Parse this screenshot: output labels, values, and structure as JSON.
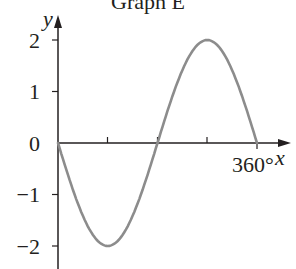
{
  "chart_data": {
    "type": "line",
    "title": "Graph E",
    "xlabel": "x",
    "ylabel": "y",
    "x_unit": "degrees",
    "xlim": [
      0,
      360
    ],
    "ylim": [
      -2,
      2
    ],
    "x_ticks": [
      90,
      180,
      270,
      360
    ],
    "x_tick_labels": [
      "",
      "",
      "",
      "360°"
    ],
    "y_ticks": [
      -2,
      -1,
      0,
      1,
      2
    ],
    "y_tick_labels": [
      "−2",
      "−1",
      "0",
      "1",
      "2"
    ],
    "grid": false,
    "series": [
      {
        "name": "y = -2 sin x",
        "x": [
          0,
          45,
          90,
          135,
          180,
          225,
          270,
          315,
          360
        ],
        "y": [
          0,
          -1.41,
          -2,
          -1.41,
          0,
          1.41,
          2,
          1.41,
          0
        ]
      }
    ],
    "colors": {
      "curve": "#8c8c8c",
      "axes": "#231f20"
    }
  }
}
